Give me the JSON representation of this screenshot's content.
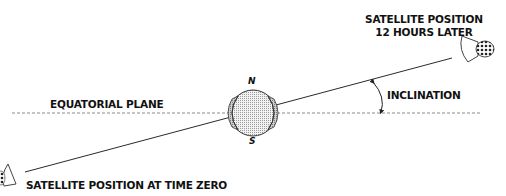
{
  "diagram": {
    "labels": {
      "satellite_12h_line1": "SATELLITE POSITION",
      "satellite_12h_line2": "12 HOURS LATER",
      "equatorial_plane": "EQUATORIAL PLANE",
      "inclination": "INCLINATION",
      "satellite_time_zero": "SATELLITE POSITION AT TIME ZERO",
      "north": "N",
      "south": "S"
    },
    "colors": {
      "line": "#2a2a2a",
      "dashed_line": "#8a8a8a",
      "globe_fill": "#d9d9d9",
      "globe_stroke": "#333333",
      "text": "#111111"
    },
    "elements": {
      "equatorial_plane": {
        "type": "dashed-line",
        "from": [
          12,
          113
        ],
        "to": [
          480,
          113
        ]
      },
      "orbit": {
        "type": "line",
        "from": [
          25,
          172
        ],
        "to": [
          452,
          58
        ]
      },
      "earth": {
        "type": "globe",
        "center": [
          253,
          113
        ],
        "radius": 23
      },
      "satellite_12h": {
        "type": "satellite-icon",
        "position": [
          475,
          48
        ]
      },
      "satellite_zero": {
        "type": "satellite-icon",
        "position": [
          6,
          176
        ]
      },
      "inclination_arc": {
        "type": "arc-arrow",
        "from": [
          372,
          82
        ],
        "to": [
          382,
          113
        ]
      }
    }
  }
}
